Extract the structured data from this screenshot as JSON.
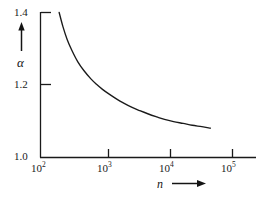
{
  "figure": {
    "background_color": "#ffffff",
    "line_color": "#1a1a1a",
    "axis_color": "#1a1a1a"
  },
  "axes": {
    "y": {
      "label": "α",
      "arrow": "up-arrow",
      "tick_labels": [
        "1.4",
        "1.2",
        "1.0"
      ],
      "tick_values": [
        1.4,
        1.2,
        1.0
      ]
    },
    "x": {
      "label": "n",
      "arrow": "right-arrow",
      "tick_labels": [
        {
          "mantissa": "10",
          "exponent": "2"
        },
        {
          "mantissa": "10",
          "exponent": "3"
        },
        {
          "mantissa": "10",
          "exponent": "4"
        },
        {
          "mantissa": "10",
          "exponent": "5"
        }
      ]
    }
  },
  "chart_data": {
    "type": "line",
    "title": "",
    "xlabel": "n",
    "ylabel": "α",
    "xscale": "log",
    "yscale": "linear",
    "xlim": [
      100,
      316228
    ],
    "ylim": [
      1.0,
      1.4
    ],
    "xticks": [
      100,
      1000,
      10000,
      100000
    ],
    "xticklabels": [
      "10^2",
      "10^3",
      "10^4",
      "10^5"
    ],
    "yticks": [
      1.0,
      1.2,
      1.4
    ],
    "yticklabels": [
      "1.0",
      "1.2",
      "1.4"
    ],
    "grid": false,
    "legend": false,
    "series": [
      {
        "name": "alpha",
        "x": [
          200,
          230,
          270,
          320,
          400,
          500,
          650,
          800,
          1000,
          1300,
          1700,
          2200,
          3000,
          4000,
          5500,
          7500,
          10000,
          14000,
          20000,
          28000,
          40000,
          55000
        ],
        "y": [
          1.4,
          1.361,
          1.325,
          1.296,
          1.264,
          1.24,
          1.217,
          1.202,
          1.188,
          1.174,
          1.161,
          1.15,
          1.138,
          1.129,
          1.12,
          1.112,
          1.105,
          1.099,
          1.094,
          1.089,
          1.085,
          1.081
        ]
      }
    ]
  }
}
